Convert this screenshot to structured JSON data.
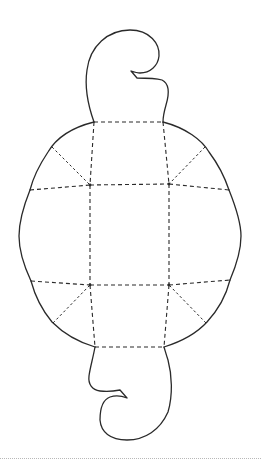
{
  "diagram": {
    "title": "",
    "colors": {
      "line": "#2a2a2a",
      "background": "#ffffff",
      "baseline": "#b8b8b8"
    },
    "legend": {
      "solid_line": "cut",
      "dashed_line": "fold"
    },
    "parts": {
      "top_tab": {
        "label": "top-curl-tab"
      },
      "bottom_tab": {
        "label": "bottom-curl-tab"
      },
      "center_square": {
        "label": "center-panel"
      },
      "flaps": [
        "top-flap",
        "right-flap",
        "bottom-flap",
        "left-flap"
      ],
      "corner_panels": [
        "top-left-corner",
        "top-right-corner",
        "bottom-left-corner",
        "bottom-right-corner"
      ]
    },
    "vertices": {
      "inner_top_left": [
        90,
        185
      ],
      "inner_top_right": [
        169,
        184
      ],
      "inner_bottom_left": [
        90,
        285
      ],
      "inner_bottom_right": [
        169,
        285
      ],
      "top_edge_left": [
        94,
        122
      ],
      "top_edge_right": [
        163,
        122
      ],
      "bottom_edge_left": [
        95,
        347
      ],
      "bottom_edge_right": [
        164,
        347
      ],
      "left_edge_top": [
        30,
        190
      ],
      "left_edge_bottom": [
        31,
        281
      ],
      "right_edge_top": [
        229,
        190
      ],
      "right_edge_bottom": [
        230,
        280
      ]
    }
  }
}
